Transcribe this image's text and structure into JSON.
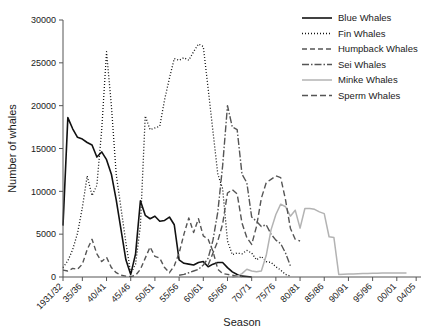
{
  "chart_data": {
    "type": "line",
    "title": "",
    "xlabel": "Season",
    "ylabel": "Number of whales",
    "ylim": [
      0,
      30000
    ],
    "ytick_values": [
      0,
      5000,
      10000,
      15000,
      20000,
      25000,
      30000
    ],
    "ytick_labels": [
      "0",
      "5000",
      "10000",
      "15000",
      "20000",
      "25000",
      "30000"
    ],
    "grid": false,
    "legend_position": "top-right",
    "x_start_year": 1931,
    "x_end_year": 2005,
    "xtick_labels": [
      "1931/32",
      "35/36",
      "40/41",
      "45/46",
      "50/51",
      "55/56",
      "60/61",
      "65/66",
      "70/71",
      "75/76",
      "80/81",
      "85/86",
      "90/91",
      "95/96",
      "00/01",
      "04/05"
    ],
    "xtick_years": [
      1931,
      1935,
      1940,
      1945,
      1950,
      1955,
      1960,
      1965,
      1970,
      1975,
      1980,
      1985,
      1990,
      1995,
      2000,
      2004
    ],
    "series": [
      {
        "name": "Blue Whales",
        "color": "#111111",
        "width": 1.6,
        "dash": "none",
        "x": [
          1931,
          1932,
          1933,
          1934,
          1935,
          1936,
          1937,
          1938,
          1939,
          1940,
          1941,
          1942,
          1943,
          1944,
          1945,
          1946,
          1947,
          1948,
          1949,
          1950,
          1951,
          1952,
          1953,
          1954,
          1955,
          1956,
          1957,
          1958,
          1959,
          1960,
          1961,
          1962,
          1963,
          1964,
          1965,
          1966,
          1967,
          1968,
          1969,
          1970
        ],
        "values": [
          6000,
          18600,
          17300,
          16300,
          16100,
          15700,
          15400,
          14000,
          14600,
          13700,
          12000,
          9000,
          5500,
          2000,
          300,
          2700,
          8900,
          7200,
          6800,
          7100,
          6500,
          6600,
          7000,
          6100,
          2000,
          1600,
          1500,
          1400,
          1700,
          1800,
          1200,
          1500,
          1700,
          1700,
          1100,
          600,
          300,
          100,
          50,
          0
        ]
      },
      {
        "name": "Fin Whales",
        "color": "#111111",
        "width": 1.3,
        "dash": "1,2",
        "x": [
          1931,
          1932,
          1933,
          1934,
          1935,
          1936,
          1937,
          1938,
          1939,
          1940,
          1941,
          1942,
          1943,
          1944,
          1945,
          1946,
          1947,
          1948,
          1949,
          1950,
          1951,
          1952,
          1953,
          1954,
          1955,
          1956,
          1957,
          1958,
          1959,
          1960,
          1961,
          1962,
          1963,
          1964,
          1965,
          1966,
          1967,
          1968,
          1969,
          1970,
          1971,
          1972,
          1973,
          1974,
          1975,
          1976,
          1977,
          1978
        ],
        "values": [
          1100,
          1900,
          3200,
          5100,
          8100,
          11800,
          9500,
          10700,
          17200,
          26300,
          20000,
          12000,
          8000,
          4000,
          400,
          1500,
          6000,
          18800,
          17200,
          17400,
          17600,
          20700,
          23200,
          25500,
          25300,
          25600,
          25300,
          26300,
          27200,
          26900,
          22000,
          17000,
          12000,
          10300,
          4200,
          2600,
          2800,
          2700,
          3100,
          2800,
          2000,
          2400,
          1800,
          1700,
          1200,
          800,
          300,
          100
        ]
      },
      {
        "name": "Humpback Whales",
        "color": "#555555",
        "width": 1.4,
        "dash": "5,3",
        "x": [
          1931,
          1932,
          1933,
          1934,
          1935,
          1936,
          1937,
          1938,
          1939,
          1940,
          1941,
          1942,
          1943,
          1944,
          1945,
          1946,
          1947,
          1948,
          1949,
          1950,
          1951,
          1952,
          1953,
          1954,
          1955,
          1956,
          1957,
          1958,
          1959,
          1960,
          1961,
          1962,
          1963,
          1964,
          1965,
          1966,
          1967,
          1968
        ],
        "values": [
          800,
          700,
          1000,
          900,
          1500,
          3200,
          4400,
          2700,
          1800,
          2300,
          1100,
          500,
          200,
          100,
          50,
          200,
          900,
          2200,
          3500,
          2400,
          2200,
          1100,
          500,
          1300,
          2800,
          5000,
          6900,
          5200,
          6800,
          4800,
          4400,
          3000,
          900,
          400,
          300,
          200,
          100,
          50
        ]
      },
      {
        "name": "Sei Whales",
        "color": "#555555",
        "width": 1.4,
        "dash": "7,2,1.5,2",
        "x": [
          1955,
          1956,
          1957,
          1958,
          1959,
          1960,
          1961,
          1962,
          1963,
          1964,
          1965,
          1966,
          1967,
          1968,
          1969,
          1970,
          1971,
          1972,
          1973,
          1974,
          1975,
          1976,
          1977,
          1978
        ],
        "values": [
          200,
          300,
          500,
          700,
          900,
          1400,
          2200,
          4300,
          7600,
          13000,
          20000,
          17500,
          17200,
          12000,
          11000,
          7000,
          6500,
          5900,
          6100,
          5000,
          4300,
          3900,
          2800,
          1300
        ]
      },
      {
        "name": "Minke Whales",
        "color": "#b3b3b3",
        "width": 1.5,
        "dash": "none",
        "x": [
          1966,
          1967,
          1968,
          1969,
          1970,
          1971,
          1972,
          1973,
          1974,
          1975,
          1976,
          1977,
          1978,
          1979,
          1980,
          1981,
          1982,
          1983,
          1984,
          1985,
          1986,
          1987,
          1988,
          1989,
          1990,
          1991,
          1992,
          1993,
          1994,
          1995,
          1996,
          1997,
          1998,
          1999,
          2000,
          2001,
          2002
        ],
        "values": [
          0,
          100,
          400,
          900,
          700,
          600,
          700,
          2500,
          5500,
          7300,
          8500,
          8200,
          7100,
          7800,
          5700,
          8000,
          8000,
          7900,
          7600,
          7400,
          4700,
          4600,
          300,
          330,
          350,
          360,
          380,
          400,
          420,
          440,
          450,
          460,
          470,
          470,
          480,
          480,
          480
        ]
      },
      {
        "name": "Sperm Whales",
        "color": "#555555",
        "width": 1.4,
        "dash": "6,3"
      }
    ],
    "sperm_whales_data": {
      "x": [
        1961,
        1962,
        1963,
        1964,
        1965,
        1966,
        1967,
        1968,
        1969,
        1970,
        1971,
        1972,
        1973,
        1974,
        1975,
        1976,
        1977,
        1978,
        1979,
        1980
      ],
      "values": [
        1400,
        2800,
        4200,
        6200,
        9800,
        10200,
        9700,
        6300,
        4600,
        3800,
        5900,
        9200,
        11000,
        11400,
        11800,
        11600,
        9000,
        5700,
        4400,
        4200
      ]
    }
  },
  "legend": {
    "entries": [
      {
        "label": "Blue Whales"
      },
      {
        "label": "Fin Whales"
      },
      {
        "label": "Humpback Whales"
      },
      {
        "label": "Sei Whales"
      },
      {
        "label": "Minke Whales"
      },
      {
        "label": "Sperm Whales"
      }
    ]
  }
}
